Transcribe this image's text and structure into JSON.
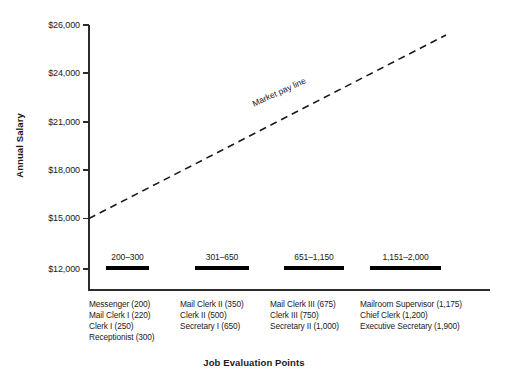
{
  "chart_data": {
    "type": "scatter",
    "title": "",
    "xlabel": "Job Evaluation Points",
    "ylabel": "Annual Salary",
    "ylim": [
      12000,
      26000
    ],
    "grid": false,
    "legend_position": "inline-annotation",
    "y_ticks": [
      {
        "label": "$26,000",
        "value": 26000
      },
      {
        "label": "$24,000",
        "value": 24000
      },
      {
        "label": "$21,000",
        "value": 21000
      },
      {
        "label": "$18,000",
        "value": 18000
      },
      {
        "label": "$15,000",
        "value": 15000
      },
      {
        "label": "$12,000",
        "value": 12000
      }
    ],
    "annotations": [
      {
        "text": "Market pay line",
        "type": "trend-line-label"
      }
    ],
    "market_pay_line": {
      "label": "Market pay line",
      "style": "dashed",
      "start": {
        "x_points": 200,
        "y_salary": 15000
      },
      "end": {
        "x_points": 2000,
        "y_salary": 25800
      }
    },
    "grades": [
      {
        "range_label": "200–300",
        "point_min": 200,
        "point_max": 300,
        "jobs": [
          "Messenger (200)",
          "Mail Clerk I (220)",
          "Clerk I (250)",
          "Receptionist (300)"
        ]
      },
      {
        "range_label": "301–650",
        "point_min": 301,
        "point_max": 650,
        "jobs": [
          "Mail Clerk II (350)",
          "Clerk II (500)",
          "Secretary I (650)"
        ]
      },
      {
        "range_label": "651–1,150",
        "point_min": 651,
        "point_max": 1150,
        "jobs": [
          "Mail Clerk III (675)",
          "Clerk III (750)",
          "Secretary II (1,000)"
        ]
      },
      {
        "range_label": "1,151–2,000",
        "point_min": 1151,
        "point_max": 2000,
        "jobs": [
          "Mailroom Supervisor (1,175)",
          "Chief Clerk (1,200)",
          "Executive Secretary (1,900)"
        ]
      }
    ],
    "colors": {
      "axis": "#2b2b2b",
      "bar": "#000000",
      "line": "#1a1a1a",
      "text": "#1a1a1a",
      "background": "#ffffff"
    }
  }
}
